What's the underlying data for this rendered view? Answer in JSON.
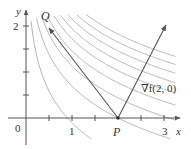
{
  "figure": {
    "type": "level-curves-with-gradient",
    "axes": {
      "x_label": "x",
      "y_label": "y",
      "origin_label": "0",
      "x_tick_labels": [
        "1",
        "3"
      ],
      "y_tick_labels": [
        "2"
      ],
      "x_range": [
        -0.35,
        3.35
      ],
      "y_range": [
        -0.6,
        2.3
      ]
    },
    "points": {
      "P": {
        "label": "P",
        "x": 2,
        "y": 0
      },
      "Q": {
        "label": "Q",
        "x": 0.5,
        "y": 2
      }
    },
    "vectors": [
      {
        "name": "PQ",
        "from": [
          2,
          0
        ],
        "to": [
          0.5,
          2
        ]
      },
      {
        "name": "gradient",
        "label": "∇f(2, 0)",
        "from": [
          2,
          0
        ],
        "to": [
          3,
          2
        ]
      }
    ],
    "level_curves": {
      "function": "f(x, y) = x e^y",
      "count": 9,
      "color": "#b0b0b0"
    },
    "colors": {
      "axis": "#555555",
      "vector": "#555555",
      "curve": "#b5b5b5",
      "text": "#333333"
    }
  }
}
